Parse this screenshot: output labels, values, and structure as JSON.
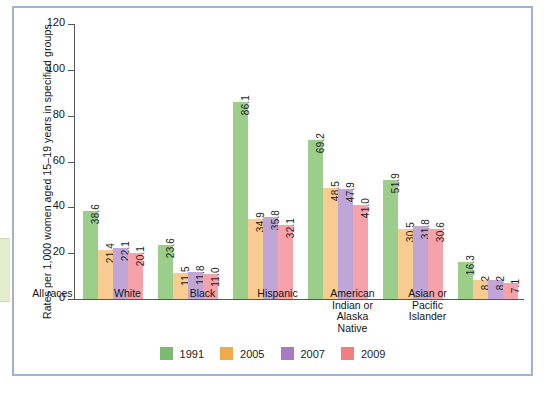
{
  "figure": {
    "edge_tab_text": "Fig."
  },
  "chart_data": {
    "type": "bar",
    "title": "",
    "xlabel": "",
    "ylabel": "Rates per 1,000 women aged 15–19 years in specified groups",
    "ylim": [
      0,
      120
    ],
    "yticks": [
      0,
      20,
      40,
      60,
      80,
      100,
      120
    ],
    "ytick_labels": [
      "0",
      "20",
      "40",
      "60",
      "80",
      "100",
      "120"
    ],
    "grid": false,
    "legend_position": "bottom",
    "categories": [
      "All races",
      "White",
      "Black",
      "Hispanic",
      "American Indian or Alaska Native",
      "Asian or Pacific Islander"
    ],
    "category_lines": [
      [
        "All races"
      ],
      [
        "White"
      ],
      [
        "Black"
      ],
      [
        "Hispanic"
      ],
      [
        "American",
        "Indian or",
        "Alaska",
        "Native"
      ],
      [
        "Asian or",
        "Pacific",
        "Islander"
      ]
    ],
    "series": [
      {
        "name": "1991",
        "color": "#9bcd8b",
        "legend_color": "#7cbb6e",
        "values": [
          38.6,
          23.6,
          86.1,
          69.2,
          51.9,
          16.3
        ],
        "labels": [
          "38.6",
          "23.6",
          "86.1",
          "69.2",
          "51.9",
          "16.3"
        ]
      },
      {
        "name": "2005",
        "color": "#f8cb90",
        "legend_color": "#f2a94c",
        "values": [
          21.4,
          11.5,
          34.9,
          48.5,
          30.5,
          8.2
        ],
        "labels": [
          "21.4",
          "11.5",
          "34.9",
          "48.5",
          "30.5",
          "8.2"
        ]
      },
      {
        "name": "2007",
        "color": "#c0a6d6",
        "legend_color": "#a879c4",
        "values": [
          22.1,
          11.8,
          35.8,
          47.9,
          31.8,
          8.2
        ],
        "labels": [
          "22.1",
          "11.8",
          "35.8",
          "47.9",
          "31.8",
          "8.2"
        ]
      },
      {
        "name": "2009",
        "color": "#f5a2aa",
        "legend_color": "#f08080",
        "values": [
          20.1,
          11.0,
          32.1,
          41.0,
          30.6,
          7.1
        ],
        "labels": [
          "20.1",
          "11.0",
          "32.1",
          "41.0",
          "30.6",
          "7.1"
        ]
      }
    ]
  }
}
